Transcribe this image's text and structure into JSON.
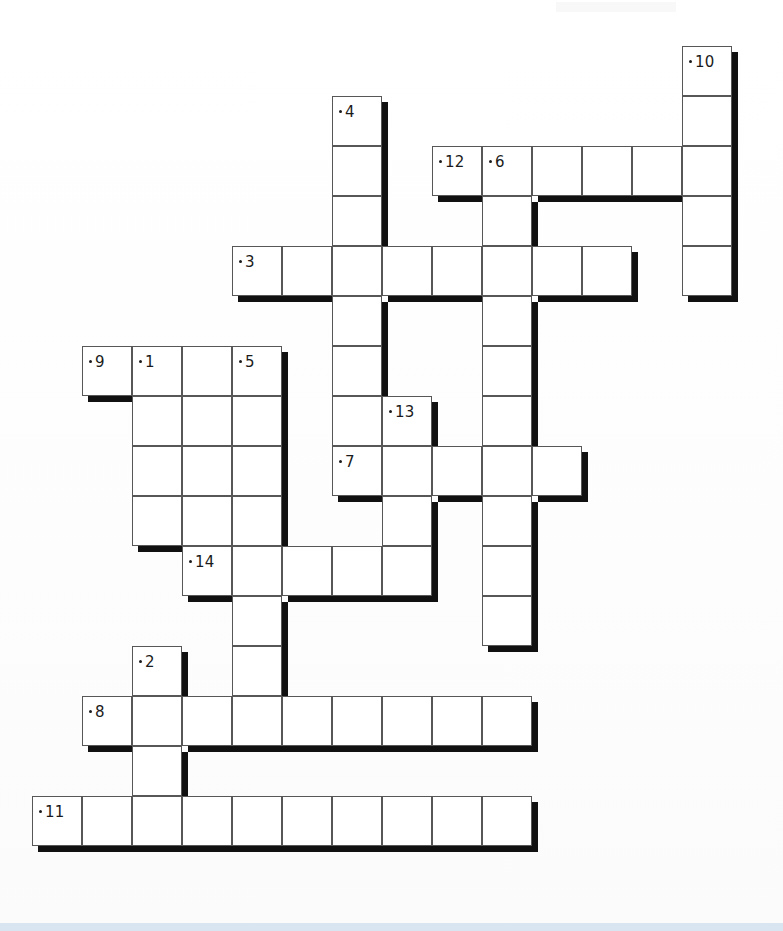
{
  "puzzle": {
    "title": "Crossword Puzzle Grid",
    "kind": "crossword-grid",
    "grid": {
      "origin_x": 32,
      "origin_y": 46,
      "cell_size": 50,
      "columns": 14,
      "rows": 17,
      "cell_fill": "#ffffff",
      "cell_stroke": "#575757",
      "shadow_color": "#111111",
      "number_color": "#1b1b1b"
    },
    "entries": [
      {
        "number": "10",
        "direction": "down",
        "row": 0,
        "col": 13,
        "length": 5
      },
      {
        "number": "4",
        "direction": "down",
        "row": 1,
        "col": 6,
        "length": 7
      },
      {
        "number": "12",
        "direction": "across",
        "row": 2,
        "col": 8,
        "length": 6
      },
      {
        "number": "6",
        "direction": "down",
        "row": 2,
        "col": 9,
        "length": 10
      },
      {
        "number": "3",
        "direction": "across",
        "row": 4,
        "col": 4,
        "length": 8
      },
      {
        "number": "9",
        "direction": "across",
        "row": 6,
        "col": 1,
        "length": 4
      },
      {
        "number": "1",
        "direction": "down",
        "row": 6,
        "col": 2,
        "length": 5
      },
      {
        "number": "5",
        "direction": "down",
        "row": 6,
        "col": 4,
        "length": 6
      },
      {
        "number": "13",
        "direction": "down",
        "row": 7,
        "col": 7,
        "length": 5
      },
      {
        "number": "7",
        "direction": "across",
        "row": 8,
        "col": 6,
        "length": 5
      },
      {
        "number": "14",
        "direction": "across",
        "row": 10,
        "col": 3,
        "length": 5
      },
      {
        "number": "2",
        "direction": "down",
        "row": 12,
        "col": 2,
        "length": 3
      },
      {
        "number": "8",
        "direction": "across",
        "row": 13,
        "col": 1,
        "length": 9
      },
      {
        "number": "11",
        "direction": "across",
        "row": 15,
        "col": 0,
        "length": 10
      }
    ],
    "cells": [
      {
        "row": 0,
        "col": 13
      },
      {
        "row": 1,
        "col": 6
      },
      {
        "row": 1,
        "col": 13
      },
      {
        "row": 2,
        "col": 6
      },
      {
        "row": 2,
        "col": 8
      },
      {
        "row": 2,
        "col": 9
      },
      {
        "row": 2,
        "col": 10
      },
      {
        "row": 2,
        "col": 11
      },
      {
        "row": 2,
        "col": 12
      },
      {
        "row": 2,
        "col": 13
      },
      {
        "row": 3,
        "col": 6
      },
      {
        "row": 3,
        "col": 9
      },
      {
        "row": 3,
        "col": 13
      },
      {
        "row": 4,
        "col": 4
      },
      {
        "row": 4,
        "col": 5
      },
      {
        "row": 4,
        "col": 6
      },
      {
        "row": 4,
        "col": 7
      },
      {
        "row": 4,
        "col": 8
      },
      {
        "row": 4,
        "col": 9
      },
      {
        "row": 4,
        "col": 10
      },
      {
        "row": 4,
        "col": 11
      },
      {
        "row": 4,
        "col": 13
      },
      {
        "row": 5,
        "col": 6
      },
      {
        "row": 5,
        "col": 9
      },
      {
        "row": 6,
        "col": 1
      },
      {
        "row": 6,
        "col": 2
      },
      {
        "row": 6,
        "col": 3
      },
      {
        "row": 6,
        "col": 4
      },
      {
        "row": 6,
        "col": 6
      },
      {
        "row": 6,
        "col": 9
      },
      {
        "row": 7,
        "col": 2
      },
      {
        "row": 7,
        "col": 3
      },
      {
        "row": 7,
        "col": 4
      },
      {
        "row": 7,
        "col": 6
      },
      {
        "row": 7,
        "col": 7
      },
      {
        "row": 7,
        "col": 9
      },
      {
        "row": 8,
        "col": 2
      },
      {
        "row": 8,
        "col": 3
      },
      {
        "row": 8,
        "col": 4
      },
      {
        "row": 8,
        "col": 6
      },
      {
        "row": 8,
        "col": 7
      },
      {
        "row": 8,
        "col": 8
      },
      {
        "row": 8,
        "col": 9
      },
      {
        "row": 8,
        "col": 10
      },
      {
        "row": 9,
        "col": 2
      },
      {
        "row": 9,
        "col": 3
      },
      {
        "row": 9,
        "col": 4
      },
      {
        "row": 9,
        "col": 7
      },
      {
        "row": 9,
        "col": 9
      },
      {
        "row": 10,
        "col": 3
      },
      {
        "row": 10,
        "col": 4
      },
      {
        "row": 10,
        "col": 5
      },
      {
        "row": 10,
        "col": 6
      },
      {
        "row": 10,
        "col": 7
      },
      {
        "row": 10,
        "col": 9
      },
      {
        "row": 11,
        "col": 4
      },
      {
        "row": 11,
        "col": 9
      },
      {
        "row": 12,
        "col": 2
      },
      {
        "row": 12,
        "col": 4
      },
      {
        "row": 13,
        "col": 1
      },
      {
        "row": 13,
        "col": 2
      },
      {
        "row": 13,
        "col": 3
      },
      {
        "row": 13,
        "col": 4
      },
      {
        "row": 13,
        "col": 5
      },
      {
        "row": 13,
        "col": 6
      },
      {
        "row": 13,
        "col": 7
      },
      {
        "row": 13,
        "col": 8
      },
      {
        "row": 13,
        "col": 9
      },
      {
        "row": 14,
        "col": 2
      },
      {
        "row": 15,
        "col": 0
      },
      {
        "row": 15,
        "col": 1
      },
      {
        "row": 15,
        "col": 2
      },
      {
        "row": 15,
        "col": 3
      },
      {
        "row": 15,
        "col": 4
      },
      {
        "row": 15,
        "col": 5
      },
      {
        "row": 15,
        "col": 6
      },
      {
        "row": 15,
        "col": 7
      },
      {
        "row": 15,
        "col": 8
      },
      {
        "row": 15,
        "col": 9
      }
    ],
    "footer": {
      "rule_color": "#d9e6f2"
    }
  }
}
